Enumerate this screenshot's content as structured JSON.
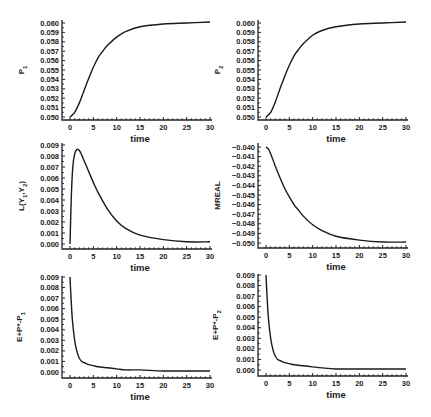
{
  "figure": {
    "background": "#ffffff",
    "ink": "#222222"
  },
  "chart_data": [
    {
      "id": "p1",
      "type": "line",
      "title": "",
      "xlabel": "time",
      "ylabel": "P1",
      "ylabel_main": "P",
      "ylabel_sub": "1",
      "xlim": [
        0,
        30
      ],
      "ylim": [
        0.05,
        0.06
      ],
      "xticks": [
        0,
        5,
        10,
        15,
        20,
        25,
        30
      ],
      "yticks": [
        "0.050",
        "0.051",
        "0.052",
        "0.053",
        "0.054",
        "0.055",
        "0.056",
        "0.057",
        "0.058",
        "0.059",
        "0.060"
      ],
      "series": [
        {
          "name": "P1",
          "x": [
            0,
            1,
            2,
            3,
            4,
            5,
            6,
            7,
            8,
            10,
            12,
            15,
            20,
            25,
            30
          ],
          "y": [
            0.05,
            0.0505,
            0.0515,
            0.0528,
            0.0541,
            0.0553,
            0.0563,
            0.057,
            0.0576,
            0.0585,
            0.0591,
            0.0596,
            0.0599,
            0.06,
            0.0601
          ]
        }
      ],
      "panel": {
        "left": 62,
        "top": 20,
        "x0": 70,
        "x1": 210,
        "yTop": 23,
        "yBot": 117,
        "axisBottom": 120
      }
    },
    {
      "id": "p2",
      "type": "line",
      "title": "",
      "xlabel": "time",
      "ylabel": "P2",
      "ylabel_main": "P",
      "ylabel_sub": "2",
      "xlim": [
        0,
        30
      ],
      "ylim": [
        0.05,
        0.06
      ],
      "xticks": [
        0,
        5,
        10,
        15,
        20,
        25,
        30
      ],
      "yticks": [
        "0.050",
        "0.051",
        "0.052",
        "0.053",
        "0.054",
        "0.055",
        "0.056",
        "0.057",
        "0.058",
        "0.059",
        "0.060"
      ],
      "series": [
        {
          "name": "P2",
          "x": [
            0,
            1,
            2,
            3,
            4,
            5,
            6,
            7,
            8,
            10,
            12,
            15,
            20,
            25,
            30
          ],
          "y": [
            0.05,
            0.0505,
            0.0516,
            0.053,
            0.0543,
            0.0555,
            0.0565,
            0.0572,
            0.0578,
            0.0587,
            0.0592,
            0.0596,
            0.0599,
            0.06,
            0.0601
          ]
        }
      ],
      "panel": {
        "left": 258,
        "top": 20,
        "x0": 266,
        "x1": 406,
        "yTop": 23,
        "yBot": 117,
        "axisBottom": 120
      }
    },
    {
      "id": "l",
      "type": "line",
      "title": "",
      "xlabel": "time",
      "ylabel": "L(Y1,Y2)",
      "ylabel_main": "L(Y",
      "ylabel_sub": "1",
      "ylabel_main2": ",Y",
      "ylabel_sub2": "2",
      "ylabel_tail": ")",
      "xlim": [
        0,
        30
      ],
      "ylim": [
        0.0,
        0.009
      ],
      "xticks": [
        0,
        5,
        10,
        15,
        20,
        25,
        30
      ],
      "yticks": [
        "0.000",
        "0.001",
        "0.002",
        "0.003",
        "0.004",
        "0.005",
        "0.006",
        "0.007",
        "0.008",
        "0.009"
      ],
      "series": [
        {
          "name": "L",
          "x": [
            0,
            0.3,
            0.6,
            1,
            1.5,
            2,
            2.5,
            3,
            4,
            5,
            6,
            8,
            10,
            12,
            15,
            20,
            25,
            30
          ],
          "y": [
            0.0,
            0.0045,
            0.007,
            0.0082,
            0.0086,
            0.0085,
            0.0081,
            0.0076,
            0.0066,
            0.0056,
            0.0047,
            0.0032,
            0.0021,
            0.0014,
            0.0008,
            0.0004,
            0.0002,
            0.0002
          ]
        }
      ],
      "panel": {
        "left": 62,
        "top": 143,
        "x0": 70,
        "x1": 210,
        "yTop": 145,
        "yBot": 244,
        "axisBottom": 249
      }
    },
    {
      "id": "mreal",
      "type": "line",
      "title": "",
      "xlabel": "time",
      "ylabel": "MREAL",
      "xlim": [
        0,
        30
      ],
      "ylim": [
        -0.05,
        -0.04
      ],
      "xticks": [
        0,
        5,
        10,
        15,
        20,
        25,
        30
      ],
      "yticks": [
        "-0.050",
        "-0.049",
        "-0.048",
        "-0.047",
        "-0.046",
        "-0.045",
        "-0.044",
        "-0.043",
        "-0.042",
        "-0.041",
        "-0.040"
      ],
      "series": [
        {
          "name": "MREAL",
          "x": [
            0,
            0.5,
            1,
            2,
            3,
            4,
            5,
            6,
            7,
            8,
            10,
            12,
            15,
            20,
            25,
            30
          ],
          "y": [
            -0.04,
            -0.0402,
            -0.0407,
            -0.042,
            -0.0432,
            -0.0443,
            -0.0452,
            -0.046,
            -0.0466,
            -0.0472,
            -0.0481,
            -0.0487,
            -0.0493,
            -0.0497,
            -0.0499,
            -0.0499
          ]
        }
      ],
      "panel": {
        "left": 258,
        "top": 143,
        "x0": 266,
        "x1": 406,
        "yTop": 147,
        "yBot": 243,
        "axisBottom": 248
      }
    },
    {
      "id": "gap1",
      "type": "line",
      "title": "",
      "xlabel": "time",
      "ylabel": "E+P*-P1",
      "ylabel_main": "E+P*-P",
      "ylabel_sub": "1",
      "xlim": [
        0,
        30
      ],
      "ylim": [
        0.0,
        0.009
      ],
      "xticks": [
        0,
        5,
        10,
        15,
        20,
        25,
        30
      ],
      "yticks": [
        "0.000",
        "0.001",
        "0.002",
        "0.003",
        "0.004",
        "0.005",
        "0.006",
        "0.007",
        "0.008",
        "0.009"
      ],
      "series": [
        {
          "name": "E+P*-P1",
          "x": [
            0,
            0.2,
            0.5,
            1,
            1.5,
            2,
            2.5,
            3,
            4,
            5,
            6,
            8,
            10,
            12,
            15,
            20,
            25,
            30
          ],
          "y": [
            0.009,
            0.0072,
            0.005,
            0.003,
            0.0019,
            0.0013,
            0.001,
            0.0009,
            0.0007,
            0.0006,
            0.0005,
            0.0004,
            0.0003,
            0.0002,
            0.0002,
            0.0001,
            0.0001,
            0.0001
          ]
        }
      ],
      "panel": {
        "left": 62,
        "top": 276,
        "x0": 70,
        "x1": 210,
        "yTop": 277,
        "yBot": 372,
        "axisBottom": 378
      }
    },
    {
      "id": "gap2",
      "type": "line",
      "title": "",
      "xlabel": "time",
      "ylabel": "E+P*-P2",
      "ylabel_main": "E+P*-P",
      "ylabel_sub": "2",
      "xlim": [
        0,
        30
      ],
      "ylim": [
        0.0,
        0.009
      ],
      "xticks": [
        0,
        5,
        10,
        15,
        20,
        25,
        30
      ],
      "yticks": [
        "0.000",
        "0.001",
        "0.002",
        "0.003",
        "0.004",
        "0.005",
        "0.006",
        "0.007",
        "0.008",
        "0.009"
      ],
      "series": [
        {
          "name": "E+P*-P2",
          "x": [
            0,
            0.2,
            0.5,
            1,
            1.5,
            2,
            2.5,
            3,
            4,
            5,
            6,
            8,
            10,
            12,
            15,
            20,
            25,
            30
          ],
          "y": [
            0.009,
            0.0072,
            0.005,
            0.003,
            0.0019,
            0.0013,
            0.001,
            0.0009,
            0.0007,
            0.0006,
            0.0005,
            0.0004,
            0.0003,
            0.0002,
            0.0001,
            0.0001,
            0.0001,
            0.0001
          ]
        }
      ],
      "panel": {
        "left": 258,
        "top": 274,
        "x0": 266,
        "x1": 406,
        "yTop": 275,
        "yBot": 370,
        "axisBottom": 376
      }
    }
  ]
}
